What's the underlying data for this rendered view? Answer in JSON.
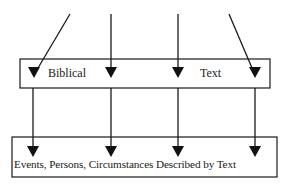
{
  "diagram": {
    "top_box": {
      "labels": [
        "Biblical",
        "Text"
      ]
    },
    "bottom_box": {
      "label": "Events, Persons, Circumstances Described by Text"
    },
    "arrows": {
      "incoming_count": 4,
      "outgoing_count": 4
    },
    "colors": {
      "stroke": "#1a1a1a",
      "background": "#ffffff"
    }
  }
}
